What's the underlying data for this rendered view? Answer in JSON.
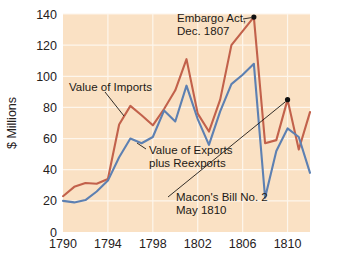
{
  "chart_data": {
    "type": "line",
    "title": "",
    "xlabel": "",
    "ylabel": "$ Millions",
    "xlim": [
      1790,
      1812
    ],
    "ylim": [
      0,
      140
    ],
    "grid": true,
    "legend_position": "inline-annotations",
    "x_ticks": [
      "1790",
      "1794",
      "1798",
      "1802",
      "1806",
      "1810"
    ],
    "x_tick_values": [
      1790,
      1794,
      1798,
      1802,
      1806,
      1810
    ],
    "y_ticks": [
      "0",
      "20",
      "40",
      "60",
      "80",
      "100",
      "120",
      "140"
    ],
    "y_tick_values": [
      0,
      20,
      40,
      60,
      80,
      100,
      120,
      140
    ],
    "x": [
      1790,
      1791,
      1792,
      1793,
      1794,
      1795,
      1796,
      1797,
      1798,
      1799,
      1800,
      1801,
      1802,
      1803,
      1804,
      1805,
      1806,
      1807,
      1808,
      1809,
      1810,
      1811,
      1812
    ],
    "series": [
      {
        "name": "Value of Imports",
        "color": "#c2614b",
        "values": [
          23,
          29,
          31.5,
          31,
          34,
          69,
          81,
          75,
          68.5,
          79,
          91,
          111,
          76,
          64.5,
          85,
          120,
          129,
          138,
          57,
          59,
          85,
          53,
          77
        ]
      },
      {
        "name": "Value of Exports plus Reexports",
        "color": "#5d80b2",
        "values": [
          20,
          19,
          20.5,
          26,
          33,
          48,
          60,
          57,
          61,
          78,
          71,
          94,
          72.5,
          56,
          77.5,
          95,
          101,
          108,
          22,
          52,
          66.5,
          61,
          38
        ]
      }
    ],
    "annotations": [
      {
        "id": "embargo-act",
        "lines": [
          "Embargo Act,",
          "Dec. 1807"
        ],
        "marker_point": {
          "x": 1807,
          "y": 138
        },
        "has_marker": true
      },
      {
        "id": "macons-bill",
        "lines": [
          "Macon's Bill No. 2",
          "May 1810"
        ],
        "marker_point": {
          "x": 1810,
          "y": 85
        },
        "has_marker": true
      },
      {
        "id": "value-of-imports-label",
        "lines": [
          "Value of Imports"
        ],
        "has_marker": false
      },
      {
        "id": "value-of-exports-label",
        "lines": [
          "Value of Exports",
          "plus Reexports"
        ],
        "has_marker": false
      }
    ],
    "colors": {
      "plot_background": "#fae1c4",
      "gridline": "#fdf6ec",
      "imports_line": "#c2614b",
      "exports_line": "#5d80b2",
      "text": "#26211c",
      "marker": "#111111"
    }
  }
}
